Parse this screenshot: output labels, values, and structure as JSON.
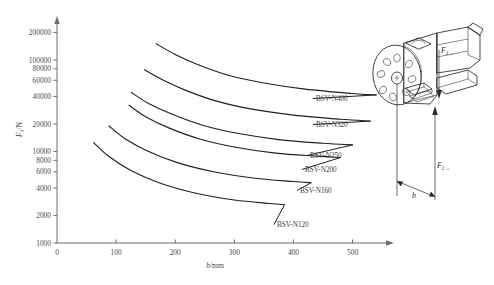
{
  "chart_data": {
    "type": "line",
    "title": "",
    "xlabel": "b/mm",
    "ylabel": "F1/N",
    "yscale": "log",
    "xlim": [
      0,
      560
    ],
    "ylim": [
      1000,
      260000
    ],
    "grid": false,
    "legend_position": "inline-right",
    "x_ticks": [
      "0",
      "100",
      "200",
      "300",
      "400",
      "500"
    ],
    "x_tick_values": [
      0,
      100,
      200,
      300,
      400,
      500
    ],
    "y_ticks": [
      "200000",
      "100000",
      "80000",
      "60000",
      "40000",
      "20000",
      "10000",
      "8000",
      "6000",
      "4000",
      "2000",
      "1000"
    ],
    "y_tick_values": [
      200000,
      100000,
      80000,
      60000,
      40000,
      20000,
      10000,
      8000,
      6000,
      4000,
      2000,
      1000
    ],
    "series": [
      {
        "name": "BSV-N400",
        "label": "BSV-N400",
        "x": [
          168,
          200,
          240,
          290,
          350,
          420,
          500,
          540
        ],
        "y": [
          150000,
          115000,
          88000,
          68000,
          56000,
          48000,
          43000,
          41500
        ]
      },
      {
        "name": "BSV-N320",
        "label": "BSV-N320",
        "x": [
          148,
          180,
          220,
          270,
          330,
          400,
          480,
          530
        ],
        "y": [
          78000,
          60000,
          46000,
          35500,
          29000,
          25000,
          22500,
          21500
        ]
      },
      {
        "name": "BSV-N250",
        "label": "BSV-N250",
        "x": [
          126,
          155,
          195,
          245,
          305,
          375,
          450,
          500
        ],
        "y": [
          44000,
          33500,
          25500,
          19500,
          15800,
          13500,
          12300,
          11800
        ]
      },
      {
        "name": "BSV-N200",
        "label": "BSV-N200",
        "x": [
          122,
          150,
          190,
          240,
          300,
          370,
          440,
          480
        ],
        "y": [
          32000,
          24000,
          18000,
          13800,
          11200,
          9600,
          8900,
          8600
        ]
      },
      {
        "name": "BSV-N160",
        "label": "BSV-N160",
        "x": [
          88,
          115,
          155,
          205,
          265,
          335,
          400,
          430
        ],
        "y": [
          19000,
          13800,
          10000,
          7500,
          6000,
          5100,
          4700,
          4550
        ]
      },
      {
        "name": "BSV-N120",
        "label": "BSV-N120",
        "x": [
          62,
          88,
          125,
          175,
          235,
          300,
          360,
          385
        ],
        "y": [
          12500,
          8800,
          6200,
          4500,
          3500,
          2950,
          2700,
          2620
        ]
      }
    ]
  },
  "axis": {
    "y_label_symbol": "F",
    "y_label_sub": "1",
    "y_label_unit": "/N",
    "x_label_symbol": "b",
    "x_label_unit": "/mm"
  },
  "diagram": {
    "name": "rotary-clamp-actuator",
    "force_label_top_symbol": "F",
    "force_label_top_sub": "1→",
    "force_label_bottom_symbol": "F",
    "force_label_bottom_sub": "1→",
    "dimension_label": "b"
  }
}
